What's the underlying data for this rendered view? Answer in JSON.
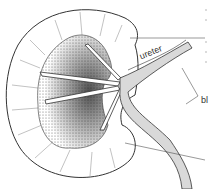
{
  "diagram": {
    "labels": {
      "ureter": "ureter",
      "blood_vessels_truncated": "bl"
    },
    "colors": {
      "outline": "#333333",
      "fill_light": "#d9d9d9",
      "background": "#ffffff"
    }
  }
}
